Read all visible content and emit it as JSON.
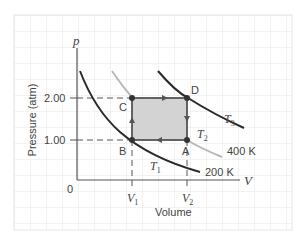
{
  "diagram": {
    "type": "pV-diagram",
    "axes": {
      "y_label": "Pressure (atm)",
      "y_symbol": "p",
      "x_label": "Volume",
      "x_symbol": "V",
      "origin_label": "0",
      "y_ticks": [
        "2.00",
        "1.00"
      ],
      "x_ticks": [
        {
          "main": "V",
          "sub": "1"
        },
        {
          "main": "V",
          "sub": "2"
        }
      ]
    },
    "points": {
      "A": "A",
      "B": "B",
      "C": "C",
      "D": "D"
    },
    "isotherms": [
      {
        "name": "T",
        "sub": "1",
        "temperature": "200 K"
      },
      {
        "name": "T",
        "sub": "2",
        "temperature": "400 K"
      },
      {
        "name": "T",
        "sub": "3",
        "temperature": ""
      }
    ],
    "cycle_order": [
      "A",
      "B",
      "C",
      "D",
      "A"
    ],
    "colors": {
      "grid": "#e6e6e6",
      "axis": "#555555",
      "isotherm_dark": "#2a2a2a",
      "isotherm_light": "#b8b8b8",
      "cycle_fill": "#d3d3d3",
      "cycle_edge": "#555555",
      "point": "#333333"
    }
  }
}
